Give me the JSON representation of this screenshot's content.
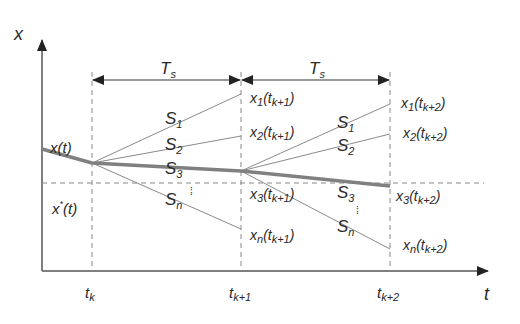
{
  "diagram": {
    "title": "",
    "axes": {
      "y_label": "x",
      "x_label": "t"
    },
    "intervals": [
      {
        "label": "T",
        "sub": "s"
      },
      {
        "label": "T",
        "sub": "s"
      }
    ],
    "time_ticks": [
      {
        "label": "t",
        "sub": "k"
      },
      {
        "label": "t",
        "sub": "k+1"
      },
      {
        "label": "t",
        "sub": "k+2"
      }
    ],
    "curve_labels": {
      "actual": {
        "main": "x(t)"
      },
      "reference": {
        "main": "x",
        "sup": "*",
        "rest": "(t)"
      }
    },
    "switching_states": {
      "first_interval": [
        {
          "label": "S",
          "sub": "1"
        },
        {
          "label": "S",
          "sub": "2"
        },
        {
          "label": "S",
          "sub": "3"
        },
        {
          "label": "S",
          "sub": "n"
        }
      ],
      "second_interval": [
        {
          "label": "S",
          "sub": "1"
        },
        {
          "label": "S",
          "sub": "2"
        },
        {
          "label": "S",
          "sub": "3"
        },
        {
          "label": "S",
          "sub": "n"
        }
      ],
      "ellipsis": "⁞"
    },
    "predictions_k1": [
      {
        "x": "x",
        "idx": "1",
        "t": "t",
        "tsub": "k+1"
      },
      {
        "x": "x",
        "idx": "2",
        "t": "t",
        "tsub": "k+1"
      },
      {
        "x": "x",
        "idx": "3",
        "t": "t",
        "tsub": "k+1"
      },
      {
        "x": "x",
        "idx": "n",
        "t": "t",
        "tsub": "k+1"
      }
    ],
    "predictions_k2": [
      {
        "x": "x",
        "idx": "1",
        "t": "t",
        "tsub": "k+2"
      },
      {
        "x": "x",
        "idx": "2",
        "t": "t",
        "tsub": "k+2"
      },
      {
        "x": "x",
        "idx": "3",
        "t": "t",
        "tsub": "k+2"
      },
      {
        "x": "x",
        "idx": "n",
        "t": "t",
        "tsub": "k+2"
      }
    ],
    "colors": {
      "axis": "#555555",
      "thin_line": "#8a8a8a",
      "thick_line": "#808080",
      "dashed": "#888888",
      "text": "#2a2a2a"
    }
  }
}
